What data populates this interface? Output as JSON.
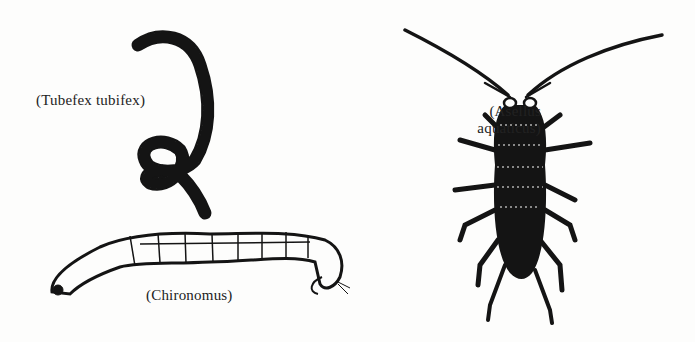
{
  "figure": {
    "background": "#fdfdfc",
    "ink": "#141414",
    "specimens": [
      {
        "id": "tubifex",
        "caption": "(Tubefex tubifex)",
        "icon": "segmented-coiled-worm"
      },
      {
        "id": "asellus",
        "caption_line1": "(Asellus",
        "caption_line2": "aquaticus)",
        "icon": "isopod-water-louse"
      },
      {
        "id": "chironomus",
        "caption": "(Chironomus)",
        "icon": "midge-larva"
      }
    ]
  }
}
